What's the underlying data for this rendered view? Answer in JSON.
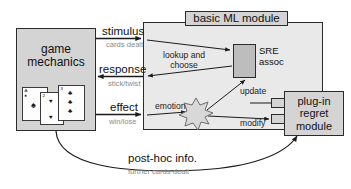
{
  "diagram": {
    "boxes": {
      "game_mechanics": "game\nmechanics",
      "game_mechanics_line1": "game",
      "game_mechanics_line2": "mechanics",
      "ml_module_title": "basic ML module",
      "sre_assoc_line1": "SRE",
      "sre_assoc_line2": "assoc",
      "plugin_line1": "plug-in",
      "plugin_line2": "regret",
      "plugin_line3": "module"
    },
    "arrow_labels": {
      "stimulus": "stimulus",
      "stimulus_sub": "cards dealt",
      "response": "response",
      "response_sub": "stick/twist",
      "effect": "effect",
      "effect_sub": "win/lose",
      "posthoc": "post-hoc info.",
      "posthoc_sub": "further cards dealt"
    },
    "inner_labels": {
      "lookup_and_choose": "lookup and choose",
      "lookup_line1": "lookup and",
      "lookup_line2": "choose",
      "emotion": "emotion",
      "update": "update",
      "modify": "modify"
    },
    "cards": {
      "card_1_rank": "A",
      "card_1_suit": "♠",
      "card_2_rank": "2",
      "card_2_suit": "♥",
      "card_3_rank": "3",
      "card_3_suit": "♣"
    },
    "colors": {
      "box_fill": "#d4d4d4",
      "container_fill": "#e9e9e9",
      "sre_fill": "#bdbdbd",
      "stroke": "#2b2b2b",
      "sub_label": "#8a8a8a",
      "starburst_fill": "#d8d8d8",
      "background": "#ffffff"
    }
  }
}
